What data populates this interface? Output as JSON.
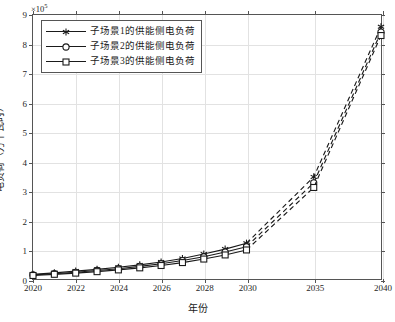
{
  "chart_data": {
    "type": "line",
    "title": "",
    "xlabel": "年份",
    "ylabel": "电负荷（万千瓦时）",
    "y_exponent_label": "×10",
    "y_exponent_power": "5",
    "y_multiplier": 100000,
    "ylim": [
      0,
      9
    ],
    "yticks": [
      0,
      1,
      2,
      3,
      4,
      5,
      6,
      7,
      8,
      9
    ],
    "ytick_labels": [
      "0",
      "1",
      "2",
      "3",
      "4",
      "5",
      "6",
      "7",
      "8",
      "9"
    ],
    "grid": true,
    "legend_position": "upper-left",
    "x": [
      2020,
      2021,
      2022,
      2023,
      2024,
      2025,
      2026,
      2027,
      2028,
      2029,
      2030,
      2035,
      2040
    ],
    "x_axis_type": "categorical-spaced",
    "xtick_values": [
      2020,
      2022,
      2024,
      2026,
      2028,
      2030,
      2035,
      2040
    ],
    "xtick_labels": [
      "2020",
      "2022",
      "2024",
      "2026",
      "2028",
      "2030",
      "2035",
      "2040"
    ],
    "solid_until": 2030,
    "series": [
      {
        "name": "子场景1的供能侧电负荷",
        "marker": "asterisk",
        "color": "#1a1a1a",
        "values": [
          0.16,
          0.21,
          0.27,
          0.33,
          0.4,
          0.48,
          0.58,
          0.7,
          0.85,
          1.02,
          1.22,
          3.48,
          8.6
        ]
      },
      {
        "name": "子场景2的供能侧电负荷",
        "marker": "circle",
        "color": "#1a1a1a",
        "values": [
          0.14,
          0.18,
          0.23,
          0.29,
          0.35,
          0.43,
          0.52,
          0.63,
          0.76,
          0.92,
          1.1,
          3.28,
          8.42
        ]
      },
      {
        "name": "子场景3的供能侧电负荷",
        "marker": "square",
        "color": "#1a1a1a",
        "values": [
          0.12,
          0.16,
          0.2,
          0.25,
          0.31,
          0.38,
          0.46,
          0.56,
          0.68,
          0.82,
          0.99,
          3.12,
          8.3
        ]
      }
    ]
  },
  "legend": {
    "items": [
      {
        "label": "子场景1的供能侧电负荷",
        "marker": "asterisk"
      },
      {
        "label": "子场景2的供能侧电负荷",
        "marker": "circle"
      },
      {
        "label": "子场景3的供能侧电负荷",
        "marker": "square"
      }
    ]
  },
  "axes": {
    "x_title": "年份",
    "y_title": "电负荷（万千瓦时）"
  },
  "colors": {
    "line": "#1a1a1a",
    "grid": "#e2e2e2",
    "frame": "#555555",
    "background": "#ffffff"
  }
}
